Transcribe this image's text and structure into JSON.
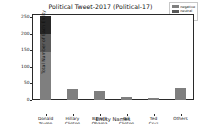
{
  "chart_data": {
    "type": "bar",
    "subtype": "stacked-bar",
    "title": "Political Tweet-2017 (Political-17)",
    "xlabel": "Entity Names",
    "ylabel": "Total Number of Each Entity",
    "categories": [
      "Donald Trump",
      "Hillary Clinton",
      "Barack Obama",
      "Bill Clinton",
      "Ted Cruz",
      "Others"
    ],
    "category_lines": [
      [
        "Donald",
        "Trump"
      ],
      [
        "Hillary",
        "Clinton"
      ],
      [
        "Barack",
        "Obama"
      ],
      [
        "Bill",
        "Clinton"
      ],
      [
        "Ted",
        "Cruz"
      ],
      [
        "Others"
      ]
    ],
    "series": [
      {
        "name": "negative",
        "color": "#7f7f7f",
        "values": [
          145,
          33,
          28,
          9,
          7,
          36
        ]
      },
      {
        "name": "neutral",
        "color": "#5a5a5a",
        "values": [
          56,
          0,
          0,
          0,
          0,
          0
        ]
      },
      {
        "name": "positive",
        "color": "#262626",
        "values": [
          54,
          0,
          0,
          0,
          0,
          0
        ]
      }
    ],
    "totals": [
      255,
      33,
      28,
      9,
      7,
      36
    ],
    "ylim": [
      0,
      260
    ],
    "yticks": [
      0,
      50,
      100,
      150,
      200,
      250
    ],
    "ytick_labels": [
      "0",
      "50",
      "100",
      "150",
      "200",
      "250"
    ],
    "grid": false,
    "legend_position": "upper right",
    "legend": [
      "negative",
      "neutral",
      "positive"
    ]
  },
  "figure": {
    "background": "#ffffff",
    "axis_color": "#2a2a2a",
    "text_color": "#111111"
  }
}
